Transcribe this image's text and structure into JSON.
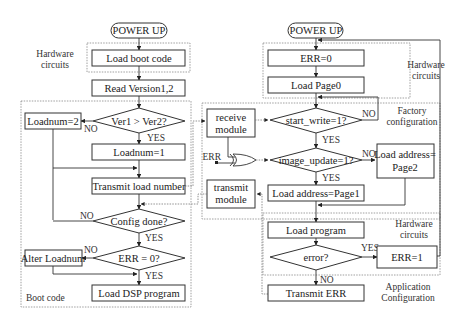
{
  "left": {
    "power_up": "POWER UP",
    "hw_label_1": "Hardware",
    "hw_label_2": "circuits",
    "load_boot": "Load boot code",
    "read_version": "Read Version1,2",
    "ver_decision": "Ver1 > Ver2?",
    "loadnum2": "Loadnum=2",
    "loadnum1": "Loadnum=1",
    "transmit_load": "Transmit load number",
    "config_done": "Config done?",
    "err_check": "ERR = 0?",
    "alter_loadnum": "Alter Loadnum",
    "load_dsp": "Load DSP program",
    "boot_code_label": "Boot code",
    "no1": "NO",
    "yes1": "YES",
    "no2": "NO",
    "yes2": "YES",
    "no3": "NO",
    "yes3": "YES"
  },
  "right": {
    "power_up": "POWER UP",
    "err0": "ERR=0",
    "load_page0": "Load Page0",
    "hw_label_1": "Hardware",
    "hw_label_2": "circuits",
    "receive_1": "receive",
    "receive_2": "module",
    "start_write": "start_write=1?",
    "factory_1": "Factory",
    "factory_2": "configuration",
    "err_input": "ERR",
    "image_update": "image_update=1?",
    "load_page2_1": "Load address=",
    "load_page2_2": "Page2",
    "transmit_1": "transmit",
    "transmit_2": "module",
    "load_page1": "Load address=Page1",
    "load_program": "Load program",
    "hw2_label_1": "Hardware",
    "hw2_label_2": "circuits",
    "error_q": "error?",
    "err1": "ERR=1",
    "transmit_err": "Transmit ERR",
    "app_1": "Application",
    "app_2": "Configuration",
    "no_sw": "NO",
    "yes_sw": "YES",
    "no_iu": "NO",
    "yes_iu": "YES",
    "yes_err": "YES",
    "no_err": "NO"
  }
}
